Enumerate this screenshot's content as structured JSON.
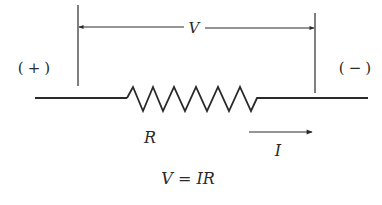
{
  "diagram": {
    "terminals": {
      "positive_label": "(+)",
      "negative_label": "(−)"
    },
    "voltage_label": "V",
    "resistor_label": "R",
    "current_label": "I",
    "equation": "V = IR",
    "colors": {
      "line": "#2a2a2a",
      "background": "#ffffff"
    }
  }
}
